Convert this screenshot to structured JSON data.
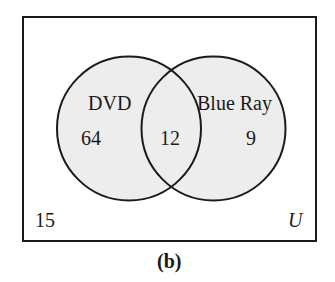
{
  "diagram": {
    "type": "venn",
    "universe_label": "U",
    "caption": "(b)",
    "sets": [
      {
        "name": "DVD",
        "only_count": "64"
      },
      {
        "name": "Blue Ray",
        "only_count": "9"
      }
    ],
    "intersection_count": "12",
    "outside_count": "15",
    "colors": {
      "circle_fill": "#ededed",
      "stroke": "#1a1a1a",
      "background": "#ffffff"
    }
  }
}
